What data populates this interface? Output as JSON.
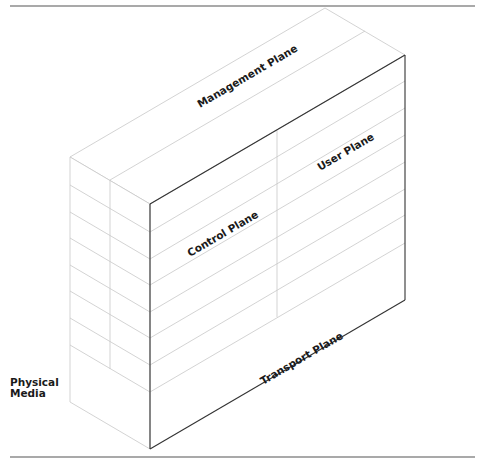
{
  "diagram": {
    "type": "isometric-box",
    "labels": {
      "management_plane": "Management Plane",
      "user_plane": "User Plane",
      "control_plane": "Control Plane",
      "transport_plane": "Transport Plane",
      "physical_media_line1": "Physical",
      "physical_media_line2": "Media"
    },
    "colors": {
      "outline": "#333333",
      "grid": "#c8c8c8",
      "text": "#1a1a1a",
      "rule": "#444444"
    }
  }
}
